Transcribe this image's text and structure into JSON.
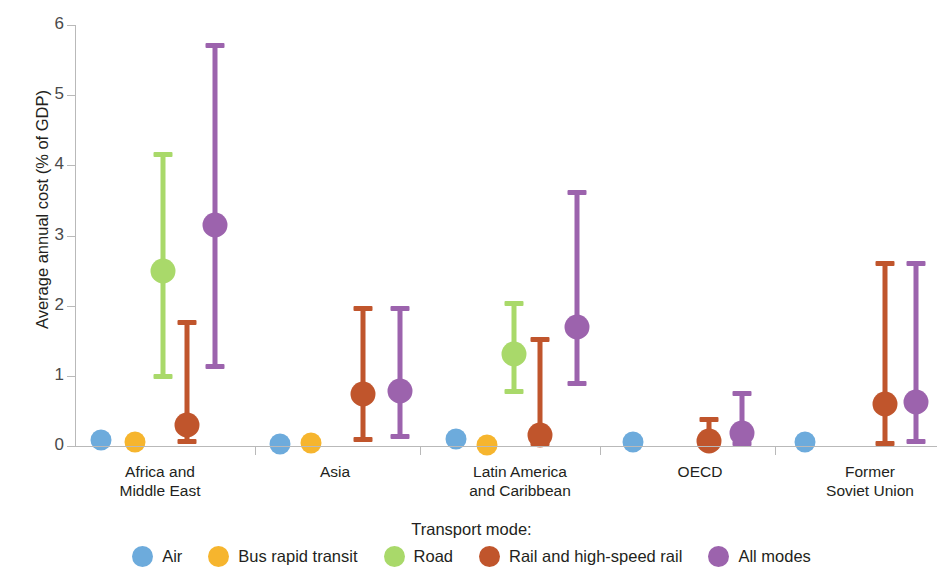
{
  "chart_data": {
    "type": "scatter",
    "title": "",
    "xlabel": "",
    "ylabel": "Average annual cost (% of GDP)",
    "ylim": [
      0,
      6
    ],
    "yticks": [
      0,
      1,
      2,
      3,
      4,
      5,
      6
    ],
    "ytick_labels": [
      "0",
      "1",
      "2",
      "3",
      "4",
      "5",
      "6"
    ],
    "grid": false,
    "legend_title": "Transport mode:",
    "legend_position": "bottom",
    "categories": [
      "Africa and\nMiddle East",
      "Asia",
      "Latin America\nand Caribbean",
      "OECD",
      "Former\nSoviet Union"
    ],
    "category_lines": [
      [
        "Africa and",
        "Middle East"
      ],
      [
        "Asia"
      ],
      [
        "Latin America",
        "and Caribbean"
      ],
      [
        "OECD"
      ],
      [
        "Former",
        "Soviet Union"
      ]
    ],
    "series": [
      {
        "name": "Air",
        "color": "#6DABDC",
        "values": [
          0.09,
          0.03,
          0.1,
          0.06,
          0.06
        ],
        "low": [
          null,
          null,
          null,
          null,
          null
        ],
        "high": [
          null,
          null,
          null,
          null,
          null
        ]
      },
      {
        "name": "Bus rapid transit",
        "color": "#F6B52E",
        "values": [
          0.06,
          0.04,
          0.02,
          null,
          null
        ],
        "low": [
          null,
          null,
          null,
          null,
          null
        ],
        "high": [
          null,
          null,
          null,
          null,
          null
        ]
      },
      {
        "name": "Road",
        "color": "#A9D96A",
        "values": [
          2.5,
          null,
          1.31,
          null,
          null
        ],
        "low": [
          0.95,
          null,
          0.74,
          null,
          null
        ],
        "high": [
          4.19,
          null,
          2.07,
          null,
          null
        ]
      },
      {
        "name": "Rail and high-speed rail",
        "color": "#C0552C",
        "values": [
          0.3,
          0.74,
          0.15,
          0.07,
          0.6
        ],
        "low": [
          0.03,
          0.06,
          0.0,
          0.0,
          0.0
        ],
        "high": [
          1.8,
          1.99,
          1.56,
          0.42,
          2.64
        ]
      },
      {
        "name": "All modes",
        "color": "#9C63AD",
        "values": [
          3.15,
          0.78,
          1.69,
          0.18,
          0.63
        ],
        "low": [
          1.1,
          0.1,
          0.86,
          0.0,
          0.03
        ],
        "high": [
          5.74,
          2.0,
          3.65,
          0.78,
          2.63
        ]
      }
    ]
  },
  "legend": {
    "title": "Transport mode:",
    "items": [
      {
        "label": "Air",
        "color": "#6DABDC"
      },
      {
        "label": "Bus rapid transit",
        "color": "#F6B52E"
      },
      {
        "label": "Road",
        "color": "#A9D96A"
      },
      {
        "label": "Rail and high-speed rail",
        "color": "#C0552C"
      },
      {
        "label": "All modes",
        "color": "#9C63AD"
      }
    ]
  },
  "axes": {
    "y_title": "Average annual cost (% of GDP)",
    "y_ticks": [
      "0",
      "1",
      "2",
      "3",
      "4",
      "5",
      "6"
    ],
    "x_groups": [
      "Africa and Middle East",
      "Asia",
      "Latin America and Caribbean",
      "OECD",
      "Former Soviet Union"
    ]
  },
  "layout": {
    "plot_left": 75,
    "plot_right": 937,
    "y_top_px": 25,
    "y_bottom_px": 446,
    "group_centers": [
      160,
      335,
      520,
      700,
      870
    ],
    "group_separators": [
      255,
      420,
      600,
      775
    ],
    "series_offsets": {
      "Africa and Middle East": {
        "Air": 101,
        "Bus rapid transit": 135,
        "Road": 163,
        "Rail and high-speed rail": 187,
        "All modes": 215
      },
      "Asia": {
        "Air": 280,
        "Bus rapid transit": 311,
        "Road": null,
        "Rail and high-speed rail": 363,
        "All modes": 400
      },
      "Latin America and Caribbean": {
        "Air": 456,
        "Bus rapid transit": 487,
        "Road": 514,
        "Rail and high-speed rail": 540,
        "All modes": 577
      },
      "OECD": {
        "Air": 633,
        "Bus rapid transit": null,
        "Road": null,
        "Rail and high-speed rail": 709,
        "All modes": 742
      },
      "Former Soviet Union": {
        "Air": 805,
        "Bus rapid transit": null,
        "Road": null,
        "Rail and high-speed rail": 885,
        "All modes": 916
      }
    }
  }
}
